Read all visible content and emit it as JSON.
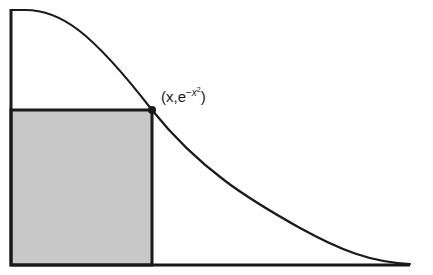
{
  "diagram": {
    "title": "",
    "function": "e^{-x^2}",
    "point_label": {
      "open": "(x,e",
      "exp_sign": "−",
      "exp_var": "x",
      "exp_power": "2",
      "close": ")"
    },
    "colors": {
      "stroke": "#1a1a1a",
      "fill": "#c8c8c8",
      "background": "#ffffff"
    },
    "geometry": {
      "origin_px": [
        11,
        265
      ],
      "x_axis_end_px": 410,
      "y_axis_top_px": 10,
      "rect_right_px": 152,
      "rect_top_px": 110,
      "point_px": [
        152,
        110
      ]
    }
  }
}
